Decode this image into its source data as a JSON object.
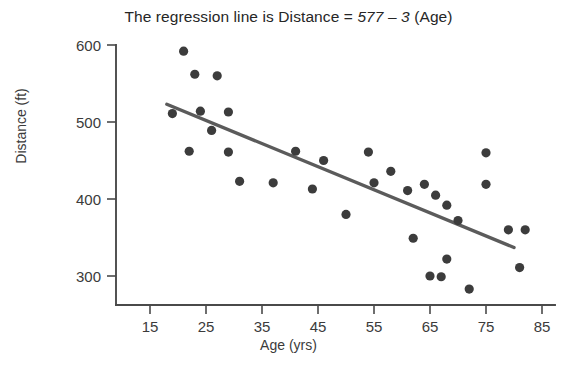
{
  "chart_data": {
    "type": "scatter",
    "title": "The regression line is Distance = 577 – 3 (Age)",
    "title_prefix": "The regression line is Distance = ",
    "title_equation": "577 – 3",
    "title_suffix": " (Age)",
    "xlabel": "Age (yrs)",
    "ylabel": "Distance (ft)",
    "xlim": [
      10,
      88
    ],
    "ylim": [
      265,
      615
    ],
    "xticks": [
      15,
      25,
      35,
      45,
      55,
      65,
      75,
      85
    ],
    "xtick_labels": [
      "15",
      "25",
      "35",
      "45",
      "55",
      "65",
      "75",
      "85"
    ],
    "yticks": [
      300,
      400,
      500,
      600
    ],
    "ytick_labels": [
      "300",
      "400",
      "500",
      "600"
    ],
    "grid": false,
    "legend": false,
    "marker_color": "#3c3c3c",
    "line_color": "#5b5b5b",
    "axis_color": "#4a4a4a",
    "regression": {
      "intercept": 577,
      "slope": -3,
      "x_start": 18,
      "x_end": 80,
      "y_start": 523,
      "y_end": 337
    },
    "points": [
      {
        "x": 21,
        "y": 592
      },
      {
        "x": 23,
        "y": 562
      },
      {
        "x": 27,
        "y": 560
      },
      {
        "x": 19,
        "y": 511
      },
      {
        "x": 24,
        "y": 514
      },
      {
        "x": 29,
        "y": 513
      },
      {
        "x": 26,
        "y": 489
      },
      {
        "x": 22,
        "y": 462
      },
      {
        "x": 29,
        "y": 461
      },
      {
        "x": 31,
        "y": 423
      },
      {
        "x": 37,
        "y": 421
      },
      {
        "x": 41,
        "y": 462
      },
      {
        "x": 46,
        "y": 450
      },
      {
        "x": 44,
        "y": 413
      },
      {
        "x": 50,
        "y": 380
      },
      {
        "x": 54,
        "y": 461
      },
      {
        "x": 55,
        "y": 421
      },
      {
        "x": 64,
        "y": 419
      },
      {
        "x": 66,
        "y": 405
      },
      {
        "x": 68,
        "y": 392
      },
      {
        "x": 70,
        "y": 372
      },
      {
        "x": 75,
        "y": 460
      },
      {
        "x": 75,
        "y": 419
      },
      {
        "x": 62,
        "y": 349
      },
      {
        "x": 68,
        "y": 322
      },
      {
        "x": 79,
        "y": 360
      },
      {
        "x": 82,
        "y": 360
      },
      {
        "x": 65,
        "y": 300
      },
      {
        "x": 67,
        "y": 299
      },
      {
        "x": 72,
        "y": 283
      },
      {
        "x": 81,
        "y": 311
      },
      {
        "x": 61,
        "y": 411
      },
      {
        "x": 58,
        "y": 436
      }
    ]
  }
}
